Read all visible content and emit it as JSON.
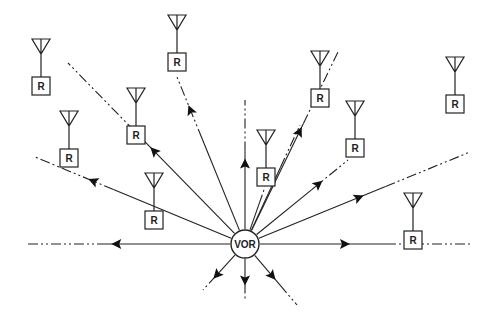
{
  "diagram": {
    "center_label": "VOR",
    "receiver_label": "R",
    "receiver_count": 10,
    "radial_count": 16
  }
}
